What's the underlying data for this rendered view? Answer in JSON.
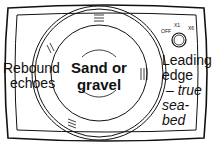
{
  "diagram": {
    "type": "echo-sounder display illustration",
    "labels": {
      "left": [
        "Rebound",
        "echoes"
      ],
      "center": [
        "Sand or",
        "gravel"
      ],
      "right": [
        "Leading",
        "edge"
      ],
      "right_italic": [
        "– true",
        "sea-bed"
      ]
    },
    "dial": {
      "off": "OFF",
      "x1": "X1",
      "x6": "X6"
    }
  }
}
